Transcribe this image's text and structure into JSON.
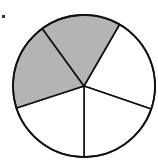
{
  "diagram": {
    "type": "fraction-circle",
    "total_parts": 5,
    "shaded_parts": 2,
    "shaded_indices": [
      0,
      1
    ],
    "colors": {
      "shaded": "#b4b4b4",
      "unshaded": "#ffffff",
      "stroke": "#111111"
    },
    "center": [
      84,
      86
    ],
    "radius": 71,
    "start_angle_deg": -60
  }
}
